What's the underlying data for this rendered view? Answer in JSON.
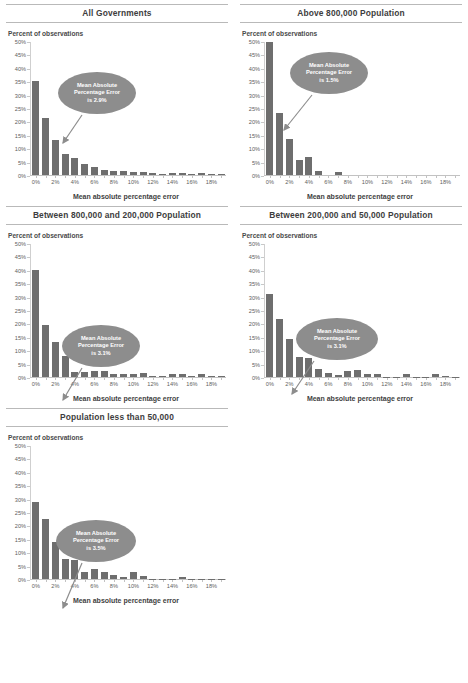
{
  "document": {
    "axis_title": "Mean absolute percentage error",
    "y_axis_label": "Percent of observations",
    "bar_color": "#6e6e6e",
    "callout_color": "#8d8d8d"
  },
  "chart_data": [
    {
      "type": "bar",
      "title": "All Governments",
      "xlabel": "Mean absolute percentage error",
      "ylabel": "Percent of observations",
      "ylim": [
        0,
        50
      ],
      "yticks": [
        "0%",
        "5%",
        "10%",
        "15%",
        "20%",
        "25%",
        "30%",
        "35%",
        "40%",
        "45%",
        "50%"
      ],
      "categories": [
        "0%",
        "1%",
        "2%",
        "3%",
        "4%",
        "5%",
        "6%",
        "7%",
        "8%",
        "9%",
        "10%",
        "11%",
        "12%",
        "13%",
        "14%",
        "15%",
        "16%",
        "17%",
        "18%",
        "19%"
      ],
      "xtick_labels": [
        "0%",
        "",
        "2%",
        "",
        "4%",
        "",
        "6%",
        "",
        "8%",
        "",
        "10%",
        "",
        "12%",
        "",
        "14%",
        "",
        "16%",
        "",
        "18%",
        ""
      ],
      "values": [
        35.0,
        21.2,
        13.1,
        7.8,
        6.3,
        4.0,
        3.1,
        2.0,
        1.5,
        1.6,
        1.2,
        1.0,
        0.6,
        0.3,
        0.6,
        0.6,
        0.2,
        0.7,
        0.2,
        0.2
      ],
      "annotation": {
        "line1": "Mean Absolute",
        "line2": "Percentage Error",
        "line3": "is 2.9%"
      }
    },
    {
      "type": "bar",
      "title": "Above 800,000 Population",
      "xlabel": "Mean absolute percentage error",
      "ylabel": "Percent of observations",
      "ylim": [
        0,
        50
      ],
      "yticks": [
        "0%",
        "5%",
        "10%",
        "15%",
        "20%",
        "25%",
        "30%",
        "35%",
        "40%",
        "45%",
        "50%"
      ],
      "categories": [
        "0%",
        "1%",
        "2%",
        "3%",
        "4%",
        "5%",
        "6%",
        "7%",
        "8%",
        "9%",
        "10%",
        "11%",
        "12%",
        "13%",
        "14%",
        "15%",
        "16%",
        "17%",
        "18%",
        "19%"
      ],
      "xtick_labels": [
        "0%",
        "",
        "2%",
        "",
        "4%",
        "",
        "6%",
        "",
        "8%",
        "",
        "10%",
        "",
        "12%",
        "",
        "14%",
        "",
        "16%",
        "",
        "18%",
        ""
      ],
      "values": [
        49.5,
        23.0,
        13.3,
        5.7,
        6.8,
        1.4,
        0.0,
        1.0,
        0.0,
        0.0,
        0.0,
        0.0,
        0.0,
        0.0,
        0.0,
        0.0,
        0.0,
        0.0,
        0.0,
        0.0
      ],
      "annotation": {
        "line1": "Mean Absolute",
        "line2": "Percentage Error",
        "line3": "is 1.5%"
      }
    },
    {
      "type": "bar",
      "title": "Between 800,000 and 200,000 Population",
      "xlabel": "Mean absolute percentage error",
      "ylabel": "Percent of observations",
      "ylim": [
        0,
        50
      ],
      "yticks": [
        "0%",
        "5%",
        "10%",
        "15%",
        "20%",
        "25%",
        "30%",
        "35%",
        "40%",
        "45%",
        "50%"
      ],
      "categories": [
        "0%",
        "1%",
        "2%",
        "3%",
        "4%",
        "5%",
        "6%",
        "7%",
        "8%",
        "9%",
        "10%",
        "11%",
        "12%",
        "13%",
        "14%",
        "15%",
        "16%",
        "17%",
        "18%",
        "19%"
      ],
      "xtick_labels": [
        "0%",
        "",
        "2%",
        "",
        "4%",
        "",
        "6%",
        "",
        "8%",
        "",
        "10%",
        "",
        "12%",
        "",
        "14%",
        "",
        "16%",
        "",
        "18%",
        ""
      ],
      "values": [
        39.9,
        19.5,
        13.0,
        7.7,
        1.7,
        2.0,
        2.2,
        2.2,
        1.3,
        1.1,
        1.3,
        1.5,
        0.3,
        0.3,
        1.2,
        1.2,
        0.2,
        1.2,
        0.2,
        0.2
      ],
      "annotation": {
        "line1": "Mean Absolute",
        "line2": "Percentage Error",
        "line3": "is 3.1%"
      }
    },
    {
      "type": "bar",
      "title": "Between 200,000 and 50,000 Population",
      "xlabel": "Mean absolute percentage error",
      "ylabel": "Percent of observations",
      "ylim": [
        0,
        50
      ],
      "yticks": [
        "0%",
        "5%",
        "10%",
        "15%",
        "20%",
        "25%",
        "30%",
        "35%",
        "40%",
        "45%",
        "50%"
      ],
      "categories": [
        "0%",
        "1%",
        "2%",
        "3%",
        "4%",
        "5%",
        "6%",
        "7%",
        "8%",
        "9%",
        "10%",
        "11%",
        "12%",
        "13%",
        "14%",
        "15%",
        "16%",
        "17%",
        "18%",
        "19%"
      ],
      "xtick_labels": [
        "0%",
        "",
        "2%",
        "",
        "4%",
        "",
        "6%",
        "",
        "8%",
        "",
        "10%",
        "",
        "12%",
        "",
        "14%",
        "",
        "16%",
        "",
        "18%",
        ""
      ],
      "values": [
        31.1,
        21.5,
        14.0,
        7.6,
        7.2,
        2.9,
        1.4,
        0.7,
        2.3,
        2.8,
        1.2,
        1.2,
        0.1,
        0.1,
        1.0,
        0.1,
        0.1,
        1.1,
        0.2,
        0.1
      ],
      "annotation": {
        "line1": "Mean Absolute",
        "line2": "Percentage Error",
        "line3": "is 3.1%"
      }
    },
    {
      "type": "bar",
      "title": "Population less than 50,000",
      "xlabel": "Mean absolute percentage error",
      "ylabel": "Percent of observations",
      "ylim": [
        0,
        50
      ],
      "yticks": [
        "0%",
        "5%",
        "10%",
        "15%",
        "20%",
        "25%",
        "30%",
        "35%",
        "40%",
        "45%",
        "50%"
      ],
      "categories": [
        "0%",
        "1%",
        "2%",
        "3%",
        "4%",
        "5%",
        "6%",
        "7%",
        "8%",
        "9%",
        "10%",
        "11%",
        "12%",
        "13%",
        "14%",
        "15%",
        "16%",
        "17%",
        "18%",
        "19%"
      ],
      "xtick_labels": [
        "0%",
        "",
        "2%",
        "",
        "4%",
        "",
        "6%",
        "",
        "8%",
        "",
        "10%",
        "",
        "12%",
        "",
        "14%",
        "",
        "16%",
        "",
        "18%",
        ""
      ],
      "values": [
        28.8,
        22.3,
        13.8,
        7.4,
        7.0,
        2.8,
        3.7,
        2.8,
        1.5,
        0.6,
        2.5,
        1.3,
        0.1,
        0.1,
        0.1,
        0.9,
        0.1,
        0.1,
        0.1,
        0.1
      ],
      "annotation": {
        "line1": "Mean Absolute",
        "line2": "Percentage Error",
        "line3": "is 3.5%"
      }
    }
  ],
  "callout_layout": [
    {
      "left": 58,
      "top": 72,
      "w": 78,
      "h": 42,
      "ax1": 82,
      "ay1": 115,
      "ax2": 63,
      "ay2": 143
    },
    {
      "left": 290,
      "top": 52,
      "w": 78,
      "h": 42,
      "ax1": 312,
      "ay1": 95,
      "ax2": 284,
      "ay2": 130
    },
    {
      "left": 62,
      "top": 325,
      "w": 78,
      "h": 42,
      "ax1": 82,
      "ay1": 368,
      "ax2": 63,
      "ay2": 400
    },
    {
      "left": 296,
      "top": 318,
      "w": 82,
      "h": 42,
      "ax1": 314,
      "ay1": 361,
      "ax2": 292,
      "ay2": 394
    },
    {
      "left": 56,
      "top": 520,
      "w": 80,
      "h": 42,
      "ax1": 82,
      "ay1": 563,
      "ax2": 63,
      "ay2": 608
    }
  ]
}
